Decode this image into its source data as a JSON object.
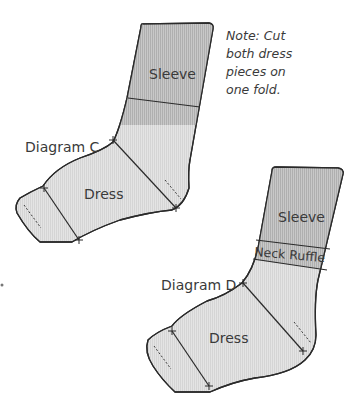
{
  "note": {
    "lines": [
      "Note: Cut",
      "both dress",
      "pieces on",
      "one fold."
    ]
  },
  "diagram_c": {
    "title": "Diagram C",
    "pieces": {
      "sleeve": "Sleeve",
      "dress": "Dress"
    }
  },
  "diagram_d": {
    "title": "Diagram D",
    "pieces": {
      "sleeve": "Sleeve",
      "neck_ruffle": "Neck Ruffle",
      "dress": "Dress"
    }
  },
  "colors": {
    "outline": "#2a2a2a",
    "light_fill": "#e2e2e2",
    "dark_fill": "#c4c4c4",
    "text": "#3a3a3a",
    "background": "#ffffff"
  }
}
